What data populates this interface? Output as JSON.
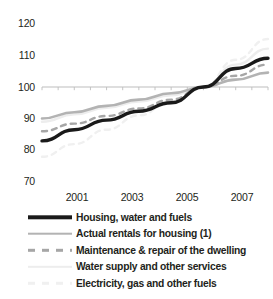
{
  "chart_data": {
    "type": "line",
    "title": "",
    "subtitle": "",
    "xlabel": "",
    "ylabel": "",
    "xlim": [
      2000,
      2007
    ],
    "ylim": [
      70,
      120
    ],
    "yticks": [
      70,
      80,
      90,
      100,
      110,
      120
    ],
    "ytick_labels": [
      "70",
      "80",
      "90",
      "100",
      "110",
      "120"
    ],
    "xticks": [
      2001,
      2003,
      2005,
      2007
    ],
    "xtick_labels": [
      "2001",
      "2003",
      "2005",
      "2007"
    ],
    "x": [
      2000,
      2001,
      2002,
      2003,
      2004,
      2005,
      2006,
      2007
    ],
    "grid": false,
    "baseline": 100,
    "legend_position": "below",
    "series": [
      {
        "name": "Housing, water and fuels",
        "style": "solid",
        "color": "#1a1a1a",
        "width": 3.4,
        "values": [
          83.0,
          86.5,
          89.5,
          92.3,
          95.0,
          100.0,
          105.8,
          109.0
        ]
      },
      {
        "name": "Actual rentals for housing (1)",
        "style": "solid",
        "color": "#b3b3b3",
        "width": 2.6,
        "values": [
          90.0,
          92.0,
          94.0,
          96.0,
          98.0,
          100.0,
          102.3,
          104.5
        ]
      },
      {
        "name": "Maintenance & repair of the dwelling",
        "style": "dashed",
        "color": "#a6a6a6",
        "width": 2.4,
        "values": [
          86.0,
          88.4,
          90.8,
          93.2,
          96.0,
          100.0,
          103.5,
          107.0
        ]
      },
      {
        "name": "Water supply and other services",
        "style": "solid",
        "color": "#ededed",
        "width": 2.4,
        "values": [
          89.0,
          91.3,
          93.4,
          95.4,
          97.4,
          100.0,
          107.0,
          112.0
        ]
      },
      {
        "name": "Electricity, gas and other fuels",
        "style": "dashed",
        "color": "#f0f0f0",
        "width": 2.4,
        "values": [
          78.0,
          82.0,
          86.5,
          91.0,
          95.5,
          100.0,
          108.5,
          115.0
        ]
      }
    ]
  },
  "axis": {
    "ytick_labels": [
      "120",
      "110",
      "100",
      "90",
      "80",
      "70"
    ],
    "xtick_labels": [
      "2001",
      "2003",
      "2005",
      "2007"
    ]
  },
  "cropped_header": "",
  "legend": {
    "items": [
      {
        "label": "Housing, water and fuels"
      },
      {
        "label": "Actual rentals for housing (1)"
      },
      {
        "label": "Maintenance & repair of the dwelling"
      },
      {
        "label": "Water supply and other services"
      },
      {
        "label": "Electricity, gas and other fuels"
      }
    ]
  }
}
